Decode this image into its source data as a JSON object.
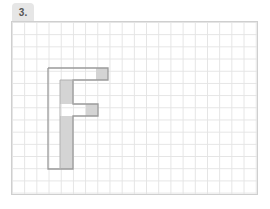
{
  "exercise": {
    "number_label": "3."
  },
  "grid": {
    "cell_size_px": 12,
    "line_color": "#e4e4e4",
    "border_color": "#cfcfcf"
  },
  "figure": {
    "letter": "F",
    "outline_color": "#9a9a9a",
    "shade_color": "#d4d4d4"
  }
}
